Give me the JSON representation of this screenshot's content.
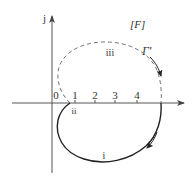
{
  "diagram": {
    "frame_label": "[F]",
    "contour_label": "Γ'",
    "axes": {
      "imag_label": "j",
      "real_ticks": [
        "0",
        "1",
        "2",
        "3",
        "4"
      ]
    },
    "segments": {
      "lower_solid": "i",
      "crossing": "ii",
      "upper_dashed": "iii"
    },
    "colors": {
      "stroke": "#222222",
      "dashed": "#777777",
      "axis": "#555555"
    }
  }
}
